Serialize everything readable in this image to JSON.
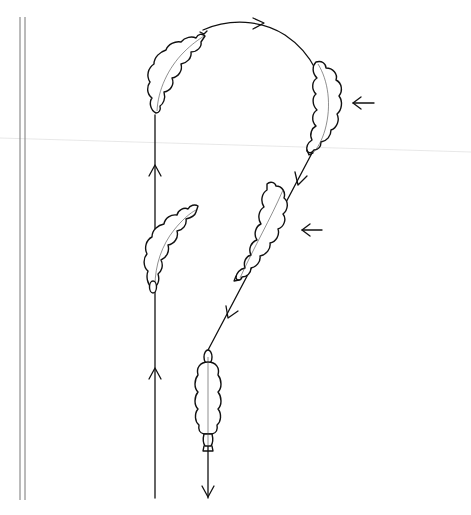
{
  "diagram": {
    "type": "riding-figure",
    "colors": {
      "line": "#111111",
      "wall": "#777777",
      "background": "#ffffff"
    },
    "arena_wall": {
      "x": [
        20,
        25
      ],
      "y_range": [
        10,
        500
      ]
    },
    "paths": [
      {
        "id": "approach-line",
        "direction": "up",
        "x": 155,
        "y_range": [
          40,
          498
        ]
      },
      {
        "id": "half-circle",
        "direction": "clockwise",
        "from": [
          155,
          50
        ],
        "apex": [
          240,
          10
        ],
        "to": [
          318,
          100
        ]
      },
      {
        "id": "diagonal-return",
        "direction": "down-left",
        "from": [
          318,
          125
        ],
        "to": [
          208,
          355
        ]
      },
      {
        "id": "exit-line",
        "direction": "down",
        "x": 208,
        "y_range": [
          355,
          500
        ]
      }
    ],
    "horses": [
      {
        "id": "horse-1",
        "position": "top-left of circle",
        "orientation": "bent along circle"
      },
      {
        "id": "horse-2",
        "position": "left line, middle",
        "orientation": "bent right, leg-yield"
      },
      {
        "id": "horse-3",
        "position": "right side of circle",
        "orientation": "bent along circle"
      },
      {
        "id": "horse-4",
        "position": "diagonal, middle",
        "orientation": "diagonal half-pass"
      },
      {
        "id": "horse-5",
        "position": "exit line, bottom",
        "orientation": "straight, heading down"
      }
    ],
    "aids_arrows": [
      {
        "id": "aid-arrow-1",
        "direction": "left",
        "position": [
          355,
          103
        ]
      },
      {
        "id": "aid-arrow-2",
        "direction": "left",
        "position": [
          302,
          230
        ]
      }
    ]
  }
}
